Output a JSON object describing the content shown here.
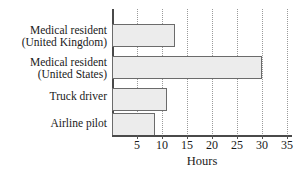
{
  "chart_data": {
    "type": "bar",
    "orientation": "horizontal",
    "title": "",
    "xlabel": "Hours",
    "ylabel": "",
    "categories": [
      "Medical resident (United Kingdom)",
      "Medical resident (United States)",
      "Truck driver",
      "Airline pilot"
    ],
    "category_lines": [
      [
        "Medical resident",
        "(United Kingdom)"
      ],
      [
        "Medical resident",
        "(United States)"
      ],
      [
        "Truck driver",
        ""
      ],
      [
        "Airline pilot",
        ""
      ]
    ],
    "values": [
      12.5,
      30,
      11,
      8.5
    ],
    "xlim": [
      0,
      36
    ],
    "xticks": [
      5,
      10,
      15,
      20,
      25,
      30,
      35
    ],
    "xtick_labels": [
      "5",
      "10",
      "15",
      "20",
      "25",
      "30",
      "35"
    ],
    "grid": "vertical-dotted",
    "legend": "none",
    "bar_fill": "#ececec",
    "bar_border": "#6b6b6b",
    "axis_color": "#4a4a4a",
    "grid_color": "#9a9a9a",
    "text_color": "#1a1a1a"
  }
}
